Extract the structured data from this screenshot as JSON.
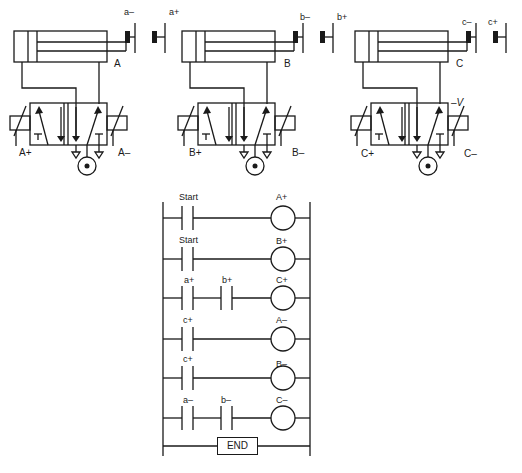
{
  "cylinders": [
    {
      "name": "A",
      "switch_retract": "a–",
      "switch_extend": "a+",
      "solenoid_left": "A+",
      "solenoid_right": "A–"
    },
    {
      "name": "B",
      "switch_retract": "b–",
      "switch_extend": "b+",
      "solenoid_left": "B+",
      "solenoid_right": "B–"
    },
    {
      "name": "C",
      "switch_retract": "c–",
      "switch_extend": "c+",
      "solenoid_left": "C+",
      "solenoid_right": "C–",
      "extra_label": "–V"
    }
  ],
  "ladder": {
    "rungs": [
      {
        "contacts": [
          "Start"
        ],
        "coil": "A+"
      },
      {
        "contacts": [
          "Start"
        ],
        "coil": "B+"
      },
      {
        "contacts": [
          "a+",
          "b+"
        ],
        "coil": "C+"
      },
      {
        "contacts": [
          "c+"
        ],
        "coil": "A–"
      },
      {
        "contacts": [
          "c+"
        ],
        "coil": "B–"
      },
      {
        "contacts": [
          "a–",
          "b–"
        ],
        "coil": "C–"
      }
    ],
    "end_label": "END"
  }
}
